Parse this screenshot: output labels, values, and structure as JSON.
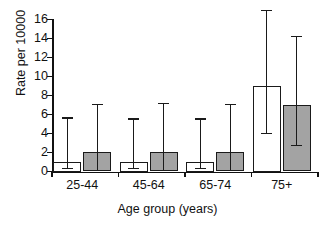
{
  "chart_data": {
    "type": "bar",
    "title": "",
    "xlabel": "Age group (years)",
    "ylabel": "Rate per 10000",
    "categories": [
      "25-44",
      "45-64",
      "65-74",
      "75+"
    ],
    "ylim": [
      0,
      16
    ],
    "yticks": [
      0,
      2,
      4,
      6,
      8,
      10,
      12,
      14,
      16
    ],
    "ytick_labels": [
      "0",
      "2",
      "4",
      "6",
      "8",
      "10",
      "12",
      "14",
      "16"
    ],
    "grid": false,
    "legend": "none",
    "series": [
      {
        "name": "white",
        "fill": "#ffffff",
        "values": [
          1.0,
          1.0,
          1.0,
          9.0
        ],
        "err_low": [
          0.4,
          0.4,
          0.4,
          4.1
        ],
        "err_high": [
          5.7,
          5.6,
          5.6,
          17.0
        ]
      },
      {
        "name": "gray",
        "fill": "#a3a3a3",
        "values": [
          2.05,
          2.1,
          2.1,
          7.05
        ],
        "err_low": [
          0.2,
          0.2,
          0.2,
          2.8
        ],
        "err_high": [
          7.1,
          7.25,
          7.15,
          14.3
        ]
      }
    ]
  },
  "colors": {
    "axis": "#111111",
    "bar_white": "#ffffff",
    "bar_gray": "#a3a3a3",
    "background": "#ffffff"
  }
}
